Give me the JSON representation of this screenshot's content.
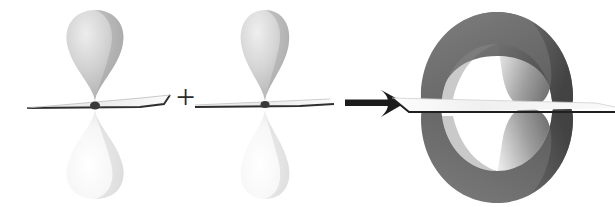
{
  "figure": {
    "background_color": "#ffffff",
    "width": 615,
    "height": 207
  },
  "operators": {
    "plus": {
      "symbol": "+",
      "name": "plus-operator",
      "x": 178,
      "y": 88,
      "size": 30,
      "color": "#2b2b2b"
    },
    "arrow": {
      "symbol": "→",
      "name": "reaction-arrow",
      "x": 345,
      "y": 103,
      "length": 62,
      "color": "#1e1e1e"
    }
  },
  "orbitals": [
    {
      "id": "p-orbital-left",
      "label": "p orbital",
      "center_x": 95,
      "center_y": 103,
      "top_lobe": {
        "name": "top-lobe",
        "phase": "shaded",
        "fill_light": "#e2e2e2",
        "fill_dark": "#a8a8a8",
        "width": 58,
        "height": 92
      },
      "bottom_lobe": {
        "name": "bottom-lobe",
        "phase": "unshaded",
        "fill_light": "#ffffff",
        "fill_dark": "#d8d8d8",
        "width": 58,
        "height": 92
      },
      "nodal_plane": {
        "name": "nodal-plane",
        "fill": "#efefef",
        "edge_color": "#2f2f2f",
        "left_extent": 68,
        "right_extent": 55
      }
    },
    {
      "id": "p-orbital-right",
      "label": "p orbital",
      "center_x": 265,
      "center_y": 103,
      "top_lobe": {
        "name": "top-lobe",
        "phase": "shaded",
        "fill_light": "#e4e4e4",
        "fill_dark": "#acacac",
        "width": 50,
        "height": 92
      },
      "bottom_lobe": {
        "name": "bottom-lobe",
        "phase": "unshaded",
        "fill_light": "#ffffff",
        "fill_dark": "#dcdcdc",
        "width": 50,
        "height": 92
      },
      "nodal_plane": {
        "name": "nodal-plane",
        "fill": "#f1f1f1",
        "edge_color": "#2f2f2f",
        "left_extent": 70,
        "right_extent": 62
      }
    }
  ],
  "product": {
    "id": "pi-molecular-orbital",
    "label": "pi molecular orbital",
    "center_x": 497,
    "center_y": 110,
    "upper_crescent": {
      "name": "upper-crescent-lobe",
      "fill": "#6e6e6e",
      "shadow": "#4a4a4a",
      "width": 150,
      "height": 88
    },
    "lower_crescent": {
      "name": "lower-crescent-lobe",
      "fill": "#6e6e6e",
      "shadow": "#4a4a4a",
      "width": 150,
      "height": 88
    },
    "nodal_plane": {
      "name": "nodal-plane",
      "fill": "#f2f2f2",
      "edge_color": "#1f1f1f",
      "left_extent": 110,
      "right_extent": 210
    }
  },
  "palette": {
    "dark_lobe": "#6e6e6e",
    "light_lobe": "#f4f4f4",
    "mid_lobe": "#c4c4c4",
    "line": "#2b2b2b",
    "background": "#ffffff"
  }
}
